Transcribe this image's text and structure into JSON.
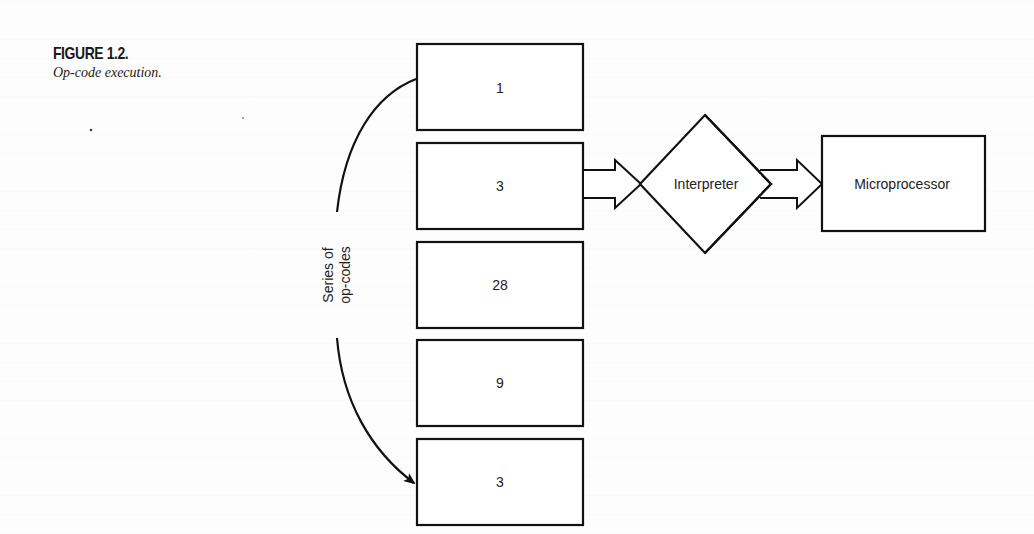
{
  "figure": {
    "number": "FIGURE 1.2.",
    "title": "Op-code execution."
  },
  "diagram": {
    "opcode_series_label_line1": "Series of",
    "opcode_series_label_line2": "op-codes",
    "opcodes": [
      {
        "value": "1"
      },
      {
        "value": "3"
      },
      {
        "value": "28"
      },
      {
        "value": "9"
      },
      {
        "value": "3"
      }
    ],
    "interpreter_label": "Interpreter",
    "microprocessor_label": "Microprocessor",
    "stroke_color": "#111111"
  }
}
